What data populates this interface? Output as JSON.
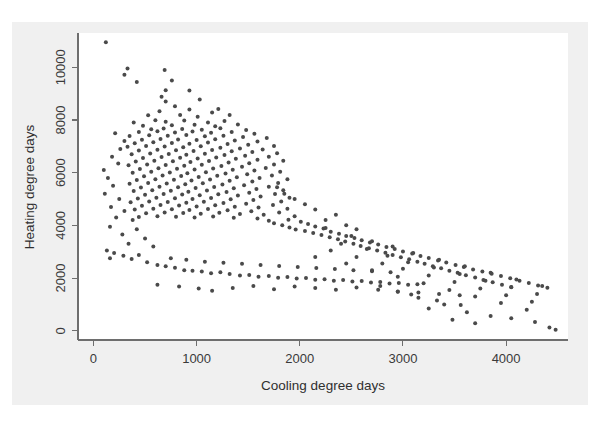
{
  "figure": {
    "background_color": "#f0f0f0",
    "plot_background_color": "#ffffff",
    "axis_color": "#6e6e6e",
    "point_color": "#4a4a4a"
  },
  "chart_data": {
    "type": "scatter",
    "title": "",
    "xlabel": "Cooling degree days",
    "ylabel": "Heating degree days",
    "xlim": [
      -150,
      4600
    ],
    "ylim": [
      -350,
      11300
    ],
    "xticks": [
      0,
      1000,
      2000,
      3000,
      4000
    ],
    "xtick_labels": [
      "0",
      "1000",
      "2000",
      "3000",
      "4000"
    ],
    "yticks": [
      0,
      2000,
      4000,
      6000,
      8000,
      10000
    ],
    "ytick_labels": [
      "0",
      "2000",
      "4000",
      "6000",
      "8000",
      "10000"
    ],
    "grid": false,
    "legend": null,
    "marker": "dot",
    "marker_size": 2.0,
    "n_points": 420,
    "points": [
      [
        120,
        10950
      ],
      [
        330,
        9950
      ],
      [
        300,
        9720
      ],
      [
        690,
        9900
      ],
      [
        420,
        9440
      ],
      [
        760,
        9500
      ],
      [
        700,
        9130
      ],
      [
        930,
        9120
      ],
      [
        660,
        8880
      ],
      [
        700,
        8700
      ],
      [
        1030,
        8780
      ],
      [
        790,
        8520
      ],
      [
        930,
        8400
      ],
      [
        640,
        8330
      ],
      [
        1210,
        8420
      ],
      [
        1150,
        8280
      ],
      [
        530,
        8180
      ],
      [
        840,
        8190
      ],
      [
        1010,
        8120
      ],
      [
        1320,
        8190
      ],
      [
        390,
        7900
      ],
      [
        600,
        7990
      ],
      [
        700,
        7930
      ],
      [
        880,
        7980
      ],
      [
        1110,
        7900
      ],
      [
        1270,
        7960
      ],
      [
        480,
        7780
      ],
      [
        760,
        7800
      ],
      [
        980,
        7820
      ],
      [
        1180,
        7760
      ],
      [
        1400,
        7830
      ],
      [
        560,
        7650
      ],
      [
        680,
        7680
      ],
      [
        860,
        7660
      ],
      [
        1050,
        7630
      ],
      [
        1230,
        7690
      ],
      [
        1480,
        7620
      ],
      [
        440,
        7540
      ],
      [
        620,
        7570
      ],
      [
        790,
        7520
      ],
      [
        960,
        7560
      ],
      [
        1140,
        7510
      ],
      [
        1340,
        7540
      ],
      [
        1560,
        7480
      ],
      [
        350,
        7390
      ],
      [
        540,
        7420
      ],
      [
        720,
        7400
      ],
      [
        900,
        7430
      ],
      [
        1080,
        7380
      ],
      [
        1260,
        7400
      ],
      [
        1450,
        7350
      ],
      [
        1680,
        7320
      ],
      [
        470,
        7250
      ],
      [
        650,
        7280
      ],
      [
        820,
        7260
      ],
      [
        1000,
        7240
      ],
      [
        1180,
        7270
      ],
      [
        1370,
        7220
      ],
      [
        1590,
        7180
      ],
      [
        400,
        7120
      ],
      [
        580,
        7150
      ],
      [
        760,
        7130
      ],
      [
        930,
        7100
      ],
      [
        1110,
        7140
      ],
      [
        1300,
        7090
      ],
      [
        1500,
        7060
      ],
      [
        1750,
        7010
      ],
      [
        330,
        6980
      ],
      [
        510,
        7010
      ],
      [
        690,
        6990
      ],
      [
        870,
        6960
      ],
      [
        1040,
        7000
      ],
      [
        1230,
        6950
      ],
      [
        1420,
        6920
      ],
      [
        1640,
        6880
      ],
      [
        440,
        6840
      ],
      [
        620,
        6870
      ],
      [
        800,
        6850
      ],
      [
        970,
        6820
      ],
      [
        1150,
        6860
      ],
      [
        1340,
        6810
      ],
      [
        1540,
        6780
      ],
      [
        1780,
        6740
      ],
      [
        370,
        6700
      ],
      [
        550,
        6730
      ],
      [
        730,
        6710
      ],
      [
        900,
        6680
      ],
      [
        1080,
        6720
      ],
      [
        1270,
        6670
      ],
      [
        1470,
        6640
      ],
      [
        1700,
        6600
      ],
      [
        480,
        6560
      ],
      [
        660,
        6590
      ],
      [
        840,
        6570
      ],
      [
        1010,
        6540
      ],
      [
        1190,
        6580
      ],
      [
        1380,
        6530
      ],
      [
        1590,
        6490
      ],
      [
        1840,
        6450
      ],
      [
        410,
        6420
      ],
      [
        590,
        6450
      ],
      [
        770,
        6430
      ],
      [
        940,
        6400
      ],
      [
        1120,
        6440
      ],
      [
        1310,
        6390
      ],
      [
        1510,
        6360
      ],
      [
        1750,
        6310
      ],
      [
        340,
        6280
      ],
      [
        520,
        6310
      ],
      [
        700,
        6290
      ],
      [
        880,
        6260
      ],
      [
        1050,
        6300
      ],
      [
        1240,
        6250
      ],
      [
        1440,
        6220
      ],
      [
        1670,
        6180
      ],
      [
        450,
        6140
      ],
      [
        630,
        6170
      ],
      [
        810,
        6150
      ],
      [
        980,
        6120
      ],
      [
        1160,
        6160
      ],
      [
        1350,
        6110
      ],
      [
        1560,
        6080
      ],
      [
        1810,
        6030
      ],
      [
        380,
        6000
      ],
      [
        560,
        6030
      ],
      [
        740,
        6010
      ],
      [
        910,
        5980
      ],
      [
        1090,
        6020
      ],
      [
        1280,
        5970
      ],
      [
        1490,
        5940
      ],
      [
        1730,
        5890
      ],
      [
        490,
        5860
      ],
      [
        670,
        5890
      ],
      [
        850,
        5870
      ],
      [
        1020,
        5840
      ],
      [
        1200,
        5880
      ],
      [
        1390,
        5830
      ],
      [
        1610,
        5800
      ],
      [
        1880,
        5750
      ],
      [
        420,
        5720
      ],
      [
        600,
        5750
      ],
      [
        780,
        5730
      ],
      [
        950,
        5700
      ],
      [
        1130,
        5740
      ],
      [
        1320,
        5690
      ],
      [
        1540,
        5660
      ],
      [
        1790,
        5610
      ],
      [
        350,
        5580
      ],
      [
        530,
        5610
      ],
      [
        710,
        5590
      ],
      [
        890,
        5560
      ],
      [
        1060,
        5600
      ],
      [
        1250,
        5550
      ],
      [
        1460,
        5520
      ],
      [
        1700,
        5470
      ],
      [
        460,
        5440
      ],
      [
        640,
        5470
      ],
      [
        820,
        5450
      ],
      [
        990,
        5420
      ],
      [
        1170,
        5460
      ],
      [
        1360,
        5410
      ],
      [
        1580,
        5380
      ],
      [
        1840,
        5330
      ],
      [
        390,
        5300
      ],
      [
        570,
        5330
      ],
      [
        750,
        5310
      ],
      [
        920,
        5280
      ],
      [
        1100,
        5320
      ],
      [
        1290,
        5270
      ],
      [
        1510,
        5240
      ],
      [
        1760,
        5190
      ],
      [
        500,
        5160
      ],
      [
        680,
        5190
      ],
      [
        860,
        5170
      ],
      [
        1030,
        5140
      ],
      [
        1210,
        5180
      ],
      [
        1400,
        5130
      ],
      [
        1620,
        5100
      ],
      [
        1900,
        5050
      ],
      [
        430,
        5020
      ],
      [
        610,
        5050
      ],
      [
        790,
        5030
      ],
      [
        960,
        5000
      ],
      [
        1140,
        5040
      ],
      [
        1330,
        4990
      ],
      [
        1550,
        4960
      ],
      [
        1820,
        4910
      ],
      [
        360,
        4880
      ],
      [
        540,
        4910
      ],
      [
        720,
        4890
      ],
      [
        900,
        4860
      ],
      [
        1070,
        4900
      ],
      [
        1260,
        4850
      ],
      [
        1480,
        4820
      ],
      [
        1740,
        4770
      ],
      [
        470,
        4740
      ],
      [
        650,
        4770
      ],
      [
        830,
        4750
      ],
      [
        1000,
        4720
      ],
      [
        1180,
        4760
      ],
      [
        1370,
        4710
      ],
      [
        1600,
        4680
      ],
      [
        1880,
        4630
      ],
      [
        400,
        4600
      ],
      [
        580,
        4630
      ],
      [
        760,
        4610
      ],
      [
        930,
        4580
      ],
      [
        1110,
        4620
      ],
      [
        1300,
        4570
      ],
      [
        1530,
        4540
      ],
      [
        1800,
        4490
      ],
      [
        510,
        4460
      ],
      [
        690,
        4490
      ],
      [
        870,
        4470
      ],
      [
        1040,
        4440
      ],
      [
        1220,
        4480
      ],
      [
        1420,
        4430
      ],
      [
        1650,
        4400
      ],
      [
        1950,
        4350
      ],
      [
        440,
        4320
      ],
      [
        620,
        4350
      ],
      [
        800,
        4330
      ],
      [
        980,
        4300
      ],
      [
        1160,
        4340
      ],
      [
        1360,
        4290
      ],
      [
        1590,
        4260
      ],
      [
        1890,
        4210
      ],
      [
        1700,
        4180
      ],
      [
        2010,
        4140
      ],
      [
        1750,
        4080
      ],
      [
        2080,
        4050
      ],
      [
        1830,
        4000
      ],
      [
        2150,
        3960
      ],
      [
        1900,
        3920
      ],
      [
        2230,
        3880
      ],
      [
        1960,
        3840
      ],
      [
        2050,
        3790
      ],
      [
        2300,
        3760
      ],
      [
        2130,
        3710
      ],
      [
        2380,
        3680
      ],
      [
        2210,
        3630
      ],
      [
        2450,
        3600
      ],
      [
        2290,
        3550
      ],
      [
        2530,
        3520
      ],
      [
        2370,
        3470
      ],
      [
        2600,
        3440
      ],
      [
        2440,
        3390
      ],
      [
        2680,
        3350
      ],
      [
        2520,
        3300
      ],
      [
        2760,
        3270
      ],
      [
        2590,
        3220
      ],
      [
        2840,
        3180
      ],
      [
        2670,
        3130
      ],
      [
        2920,
        3100
      ],
      [
        2750,
        3050
      ],
      [
        3000,
        3010
      ],
      [
        2830,
        2960
      ],
      [
        3090,
        2930
      ],
      [
        2900,
        2880
      ],
      [
        3170,
        2840
      ],
      [
        2980,
        2790
      ],
      [
        3250,
        2760
      ],
      [
        3060,
        2710
      ],
      [
        3340,
        2670
      ],
      [
        3140,
        2620
      ],
      [
        3420,
        2590
      ],
      [
        3210,
        2540
      ],
      [
        3510,
        2500
      ],
      [
        3290,
        2450
      ],
      [
        3590,
        2420
      ],
      [
        3370,
        2370
      ],
      [
        3680,
        2330
      ],
      [
        3450,
        2280
      ],
      [
        3770,
        2250
      ],
      [
        3530,
        2200
      ],
      [
        3860,
        2160
      ],
      [
        3610,
        2110
      ],
      [
        3950,
        2080
      ],
      [
        3700,
        2020
      ],
      [
        4040,
        1990
      ],
      [
        3780,
        1930
      ],
      [
        4130,
        1900
      ],
      [
        3870,
        1840
      ],
      [
        4220,
        1810
      ],
      [
        3960,
        1750
      ],
      [
        4310,
        1720
      ],
      [
        4050,
        1660
      ],
      [
        4400,
        1630
      ],
      [
        2250,
        3900
      ],
      [
        2500,
        3600
      ],
      [
        2700,
        3400
      ],
      [
        2900,
        3200
      ],
      [
        3100,
        2950
      ],
      [
        3350,
        2700
      ],
      [
        3600,
        2450
      ],
      [
        3850,
        2200
      ],
      [
        4100,
        1950
      ],
      [
        4350,
        1700
      ],
      [
        2400,
        3300
      ],
      [
        2650,
        3100
      ],
      [
        2850,
        2850
      ],
      [
        3050,
        2600
      ],
      [
        3300,
        2400
      ],
      [
        3550,
        2150
      ],
      [
        3800,
        1900
      ],
      [
        4050,
        1650
      ],
      [
        4300,
        1400
      ],
      [
        2300,
        3050
      ],
      [
        2550,
        2800
      ],
      [
        2800,
        2550
      ],
      [
        3000,
        2350
      ],
      [
        3250,
        2100
      ],
      [
        3500,
        1850
      ],
      [
        3750,
        1600
      ],
      [
        4000,
        1350
      ],
      [
        4250,
        1100
      ],
      [
        2150,
        2800
      ],
      [
        2450,
        2550
      ],
      [
        2700,
        2300
      ],
      [
        2950,
        2050
      ],
      [
        3200,
        1800
      ],
      [
        3450,
        1550
      ],
      [
        3700,
        1300
      ],
      [
        3950,
        1050
      ],
      [
        4200,
        800
      ],
      [
        3150,
        1250
      ],
      [
        3400,
        1000
      ],
      [
        3250,
        850
      ],
      [
        3620,
        700
      ],
      [
        3850,
        560
      ],
      [
        4050,
        480
      ],
      [
        4280,
        330
      ],
      [
        4420,
        120
      ],
      [
        3480,
        420
      ],
      [
        3700,
        290
      ],
      [
        2950,
        1480
      ],
      [
        3080,
        1380
      ],
      [
        3330,
        1150
      ],
      [
        3560,
        980
      ],
      [
        2780,
        1700
      ],
      [
        140,
        5800
      ],
      [
        190,
        5500
      ],
      [
        110,
        5200
      ],
      [
        250,
        5000
      ],
      [
        170,
        4700
      ],
      [
        300,
        4550
      ],
      [
        220,
        4300
      ],
      [
        380,
        4200
      ],
      [
        160,
        3950
      ],
      [
        420,
        3850
      ],
      [
        280,
        3650
      ],
      [
        500,
        3500
      ],
      [
        340,
        3300
      ],
      [
        580,
        3200
      ],
      [
        130,
        3050
      ],
      [
        200,
        2950
      ],
      [
        290,
        2850
      ],
      [
        160,
        2750
      ],
      [
        370,
        2720
      ],
      [
        440,
        2880
      ],
      [
        520,
        2600
      ],
      [
        620,
        2500
      ],
      [
        700,
        2450
      ],
      [
        790,
        2390
      ],
      [
        880,
        2300
      ],
      [
        960,
        2280
      ],
      [
        1050,
        2250
      ],
      [
        1140,
        2180
      ],
      [
        1230,
        2220
      ],
      [
        1320,
        2150
      ],
      [
        1420,
        2100
      ],
      [
        1510,
        2120
      ],
      [
        1600,
        2050
      ],
      [
        1700,
        2080
      ],
      [
        1790,
        2010
      ],
      [
        1880,
        2040
      ],
      [
        1970,
        1980
      ],
      [
        2060,
        2000
      ],
      [
        2150,
        1940
      ],
      [
        2240,
        1960
      ],
      [
        2330,
        1900
      ],
      [
        2420,
        1930
      ],
      [
        2510,
        1870
      ],
      [
        2600,
        1890
      ],
      [
        2690,
        1830
      ],
      [
        2780,
        1850
      ],
      [
        2870,
        1790
      ],
      [
        2960,
        1810
      ],
      [
        3050,
        1750
      ],
      [
        3140,
        1770
      ],
      [
        750,
        2750
      ],
      [
        900,
        2700
      ],
      [
        1080,
        2620
      ],
      [
        1260,
        2580
      ],
      [
        1440,
        2540
      ],
      [
        1620,
        2500
      ],
      [
        1800,
        2460
      ],
      [
        1980,
        2420
      ],
      [
        2160,
        2380
      ],
      [
        2340,
        2340
      ],
      [
        2520,
        2300
      ],
      [
        2700,
        2260
      ],
      [
        2880,
        2220
      ],
      [
        1150,
        1520
      ],
      [
        1350,
        1620
      ],
      [
        1550,
        1700
      ],
      [
        1750,
        1580
      ],
      [
        1950,
        1680
      ],
      [
        2150,
        1620
      ],
      [
        2350,
        1560
      ],
      [
        2550,
        1640
      ],
      [
        620,
        1750
      ],
      [
        830,
        1680
      ],
      [
        1020,
        1600
      ],
      [
        2760,
        1560
      ],
      [
        2950,
        1490
      ],
      [
        3150,
        1450
      ],
      [
        3350,
        1400
      ],
      [
        3550,
        1350
      ],
      [
        100,
        6100
      ],
      [
        240,
        6350
      ],
      [
        180,
        6600
      ],
      [
        260,
        6900
      ],
      [
        300,
        7200
      ],
      [
        210,
        7500
      ],
      [
        2250,
        4200
      ],
      [
        2350,
        4400
      ],
      [
        2150,
        4600
      ],
      [
        2050,
        4800
      ],
      [
        1950,
        5000
      ],
      [
        2450,
        4000
      ],
      [
        2550,
        3850
      ],
      [
        1850,
        5200
      ],
      [
        1780,
        5450
      ],
      [
        4480,
        40
      ]
    ]
  }
}
